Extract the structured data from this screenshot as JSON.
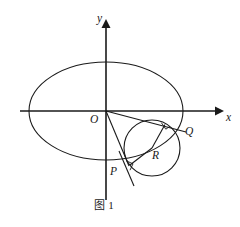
{
  "figure": {
    "caption": "图 1",
    "axes": {
      "x_label": "x",
      "y_label": "y",
      "origin_label": "O"
    },
    "points": [
      {
        "id": "O",
        "label": "O",
        "x": 106,
        "y": 111,
        "label_x": 91,
        "label_y": 116
      },
      {
        "id": "P",
        "label": "P",
        "x": 129,
        "y": 165,
        "label_x": 111,
        "label_y": 168
      },
      {
        "id": "Q",
        "label": "Q",
        "x": 182,
        "y": 128,
        "label_x": 185,
        "label_y": 128
      },
      {
        "id": "R",
        "label": "R",
        "x": 152,
        "y": 148,
        "label_x": 153,
        "label_y": 152
      }
    ],
    "shapes": {
      "ellipse": {
        "cx": 106,
        "cy": 111,
        "rx": 77,
        "ry": 49
      },
      "circle": {
        "cx": 152,
        "cy": 148,
        "r": 28
      }
    },
    "marks": {
      "right_angle_at_tangent_foot": "right-angle",
      "right_angle_at_P": "right-angle"
    },
    "stroke_color": "#1a1a1a",
    "background_color": "#ffffff"
  }
}
